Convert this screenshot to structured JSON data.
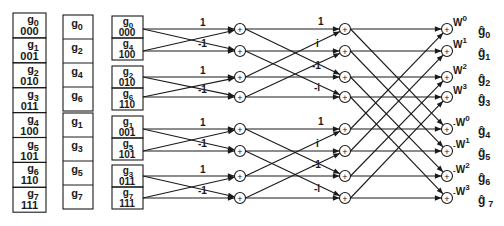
{
  "diagram": {
    "type": "fft-butterfly",
    "points": 8,
    "stroke_color": "#1a1a1a",
    "background": "#ffffff"
  },
  "col1": {
    "cells": [
      {
        "label": "g",
        "sub": "0",
        "bits": "000"
      },
      {
        "label": "g",
        "sub": "1",
        "bits": "001"
      },
      {
        "label": "g",
        "sub": "2",
        "bits": "010"
      },
      {
        "label": "g",
        "sub": "3",
        "bits": "011"
      },
      {
        "label": "g",
        "sub": "4",
        "bits": "100"
      },
      {
        "label": "g",
        "sub": "5",
        "bits": "101"
      },
      {
        "label": "g",
        "sub": "6",
        "bits": "110"
      },
      {
        "label": "g",
        "sub": "7",
        "bits": "111"
      }
    ]
  },
  "col2": {
    "top": [
      {
        "label": "g",
        "sub": "0"
      },
      {
        "label": "g",
        "sub": "2"
      },
      {
        "label": "g",
        "sub": "4"
      },
      {
        "label": "g",
        "sub": "6"
      }
    ],
    "bottom": [
      {
        "label": "g",
        "sub": "1"
      },
      {
        "label": "g",
        "sub": "3"
      },
      {
        "label": "g",
        "sub": "5"
      },
      {
        "label": "g",
        "sub": "7"
      }
    ]
  },
  "col3": {
    "cells": [
      {
        "label": "g",
        "sub": "0",
        "bits": "000"
      },
      {
        "label": "g",
        "sub": "4",
        "bits": "100"
      },
      {
        "label": "g",
        "sub": "2",
        "bits": "010"
      },
      {
        "label": "g",
        "sub": "6",
        "bits": "110"
      },
      {
        "label": "g",
        "sub": "1",
        "bits": "001"
      },
      {
        "label": "g",
        "sub": "5",
        "bits": "101"
      },
      {
        "label": "g",
        "sub": "3",
        "bits": "011"
      },
      {
        "label": "g",
        "sub": "7",
        "bits": "111"
      }
    ]
  },
  "stage1": {
    "weights": [
      "1",
      "-1",
      "1",
      "-1",
      "1",
      "-1",
      "1",
      "-1"
    ]
  },
  "stage2": {
    "weights": [
      "1",
      "i",
      "-1",
      "-i",
      "1",
      "i",
      "-1",
      "-i"
    ]
  },
  "stage3": {
    "twiddles": [
      {
        "prefix": "",
        "base": "W",
        "exp": "0"
      },
      {
        "prefix": "",
        "base": "W",
        "exp": "1"
      },
      {
        "prefix": "",
        "base": "W",
        "exp": "2"
      },
      {
        "prefix": "",
        "base": "W",
        "exp": "3"
      },
      {
        "prefix": "-",
        "base": "W",
        "exp": "0"
      },
      {
        "prefix": "-",
        "base": "W",
        "exp": "1"
      },
      {
        "prefix": "-",
        "base": "W",
        "exp": "2"
      },
      {
        "prefix": "-",
        "base": "W",
        "exp": "3"
      }
    ]
  },
  "outputs": [
    {
      "label": "ĝ",
      "sub": "0"
    },
    {
      "label": "ĝ",
      "sub": "1"
    },
    {
      "label": "ĝ",
      "sub": "2"
    },
    {
      "label": "ĝ",
      "sub": "3"
    },
    {
      "label": "ĝ",
      "sub": "4"
    },
    {
      "label": "ĝ",
      "sub": "5"
    },
    {
      "label": "ĝ",
      "sub": "6"
    },
    {
      "label": "ĝ",
      "sub": "7"
    }
  ],
  "adder_symbol": "+"
}
